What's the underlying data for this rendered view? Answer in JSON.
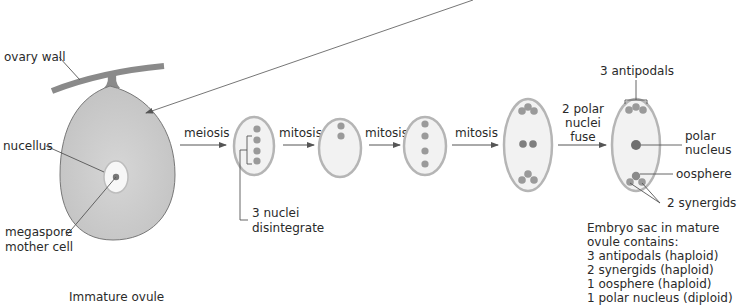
{
  "colors": {
    "ovule_fill": "#c9c9c9",
    "ovule_stroke": "#777777",
    "ovary_wall": "#8a8a8a",
    "sac_stroke": "#b5b5b5",
    "sac_fill": "#f2f2f2",
    "nucleus": "#9a9a9a",
    "nucleus_dark": "#6f6f6f",
    "line": "#555555",
    "text": "#2a2a2a"
  },
  "ovule": {
    "caption": "Immature ovule",
    "labels": {
      "ovary_wall": "ovary wall",
      "nucellus": "nucellus",
      "megaspore_line1": "megaspore",
      "megaspore_line2": "mother cell"
    }
  },
  "steps": [
    {
      "label": "meiosis"
    },
    {
      "label": "mitosis"
    },
    {
      "label": "mitosis"
    },
    {
      "label": "mitosis"
    },
    {
      "label_lines": [
        "2 polar",
        "nuclei",
        "fuse"
      ]
    }
  ],
  "disintegrate_note": {
    "line1": "3 nuclei",
    "line2": "disintegrate"
  },
  "mature_sac": {
    "labels": {
      "antipodals": "3 antipodals",
      "polar_line1": "polar",
      "polar_line2": "nucleus",
      "oosphere": "oosphere",
      "synergids": "2 synergids"
    },
    "summary": {
      "heading_line1": "Embryo sac in mature",
      "heading_line2": "ovule contains:",
      "items": [
        "3 antipodals (haploid)",
        "2 synergids (haploid)",
        "1 oosphere (haploid)",
        "1 polar nucleus (diploid)"
      ]
    }
  }
}
